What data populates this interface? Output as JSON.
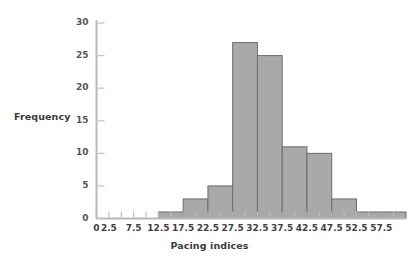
{
  "chart_data": {
    "type": "bar",
    "title": "",
    "subtitle": "",
    "xlabel": "Pacing indices",
    "ylabel": "Frequency",
    "grid": false,
    "legend": null,
    "bin_width": 5,
    "xlim": [
      0,
      62.5
    ],
    "ylim": [
      0,
      30
    ],
    "y_ticks": [
      0,
      5,
      10,
      15,
      20,
      25,
      30
    ],
    "y_tick_labels": [
      "0",
      "5",
      "10",
      "15",
      "20",
      "25",
      "30"
    ],
    "x_ticks": [
      0,
      2.5,
      5,
      7.5,
      10,
      12.5,
      15,
      17.5,
      20,
      22.5,
      25,
      27.5,
      30,
      32.5,
      35,
      37.5,
      40,
      42.5,
      45,
      47.5,
      50,
      52.5,
      55,
      57.5,
      60
    ],
    "x_tick_labels": [
      "0",
      "2.5",
      "",
      "7.5",
      "",
      "12.5",
      "",
      "17.5",
      "",
      "22.5",
      "",
      "27.5",
      "",
      "32.5",
      "",
      "37.5",
      "",
      "42.5",
      "",
      "47.5",
      "",
      "52.5",
      "",
      "57.5",
      ""
    ],
    "bin_edges": [
      12.5,
      17.5,
      22.5,
      27.5,
      32.5,
      37.5,
      42.5,
      47.5,
      52.5,
      57.5,
      62.5
    ],
    "categories": [
      "12.5-17.5",
      "17.5-22.5",
      "22.5-27.5",
      "27.5-32.5",
      "32.5-37.5",
      "37.5-42.5",
      "42.5-47.5",
      "47.5-52.5",
      "52.5-57.5",
      "57.5-62.5"
    ],
    "values": [
      1,
      3,
      5,
      27,
      25,
      11,
      10,
      3,
      1,
      1
    ],
    "bar_fill_color": "#a9a9a9",
    "bar_edge_color": "#6d6d6d",
    "axis_color": "#b4b4b4",
    "tick_label_color": "#4a4a4a"
  }
}
